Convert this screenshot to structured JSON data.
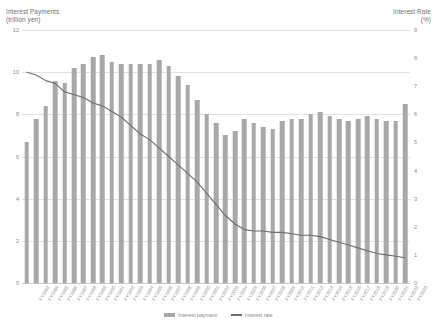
{
  "chart_data": {
    "type": "bar",
    "title": "",
    "subtitle": "",
    "left_axis_title": "Interest Payments\n(trillion yen)",
    "right_axis_title": "Interest Rate\n(%)",
    "xlabel": "",
    "ylabel": "Interest Payments (trillion yen)",
    "y2label": "Interest Rate (%)",
    "ylim": [
      0,
      12
    ],
    "y2lim": [
      0,
      9
    ],
    "yticks": [
      0,
      2,
      4,
      6,
      8,
      10,
      12
    ],
    "y2ticks": [
      0,
      1,
      2,
      3,
      4,
      5,
      6,
      7,
      8,
      9
    ],
    "grid": true,
    "legend_position": "bottom",
    "categories": [
      "FY1983",
      "FY1984",
      "FY1985",
      "FY1986",
      "FY1987",
      "FY1988",
      "FY1989",
      "FY1990",
      "FY1991",
      "FY1992",
      "FY1993",
      "FY1994",
      "FY1995",
      "FY1996",
      "FY1997",
      "FY1998",
      "FY1999",
      "FY2000",
      "FY2001",
      "FY2002",
      "FY2003",
      "FY2004",
      "FY2005",
      "FY2006",
      "FY2007",
      "FY2008",
      "FY2009",
      "FY2010",
      "FY2011",
      "FY2012",
      "FY2013",
      "FY2014",
      "FY2015",
      "FY2016",
      "FY2017",
      "FY2018",
      "FY2019",
      "FY2020",
      "FY2021",
      "FY2022",
      "FY2023"
    ],
    "series": [
      {
        "name": "Interest payment",
        "type": "bar",
        "axis": "left",
        "unit": "trillion yen",
        "color": "#a8a8a8",
        "values": [
          6.7,
          7.8,
          8.4,
          9.6,
          9.5,
          10.2,
          10.4,
          10.7,
          10.8,
          10.5,
          10.4,
          10.4,
          10.4,
          10.4,
          10.6,
          10.3,
          9.8,
          9.4,
          8.7,
          8.0,
          7.6,
          7.0,
          7.2,
          7.8,
          7.6,
          7.4,
          7.3,
          7.7,
          7.8,
          7.8,
          8.0,
          8.1,
          7.9,
          7.8,
          7.7,
          7.8,
          7.9,
          7.8,
          7.7,
          7.7,
          8.5
        ]
      },
      {
        "name": "Interest rate",
        "type": "line",
        "axis": "right",
        "unit": "%",
        "color": "#6d6d6d",
        "values": [
          7.5,
          7.4,
          7.2,
          7.1,
          6.8,
          6.7,
          6.6,
          6.4,
          6.3,
          6.1,
          5.9,
          5.6,
          5.3,
          5.1,
          4.8,
          4.5,
          4.2,
          3.9,
          3.6,
          3.2,
          2.8,
          2.4,
          2.1,
          1.9,
          1.85,
          1.85,
          1.8,
          1.8,
          1.75,
          1.7,
          1.7,
          1.65,
          1.55,
          1.45,
          1.35,
          1.25,
          1.15,
          1.05,
          1.0,
          0.95,
          0.9
        ]
      }
    ],
    "legend": [
      {
        "label": "Interest payment",
        "marker": "bar",
        "color": "#a8a8a8"
      },
      {
        "label": "Interest rate",
        "marker": "line",
        "color": "#6d6d6d"
      }
    ]
  }
}
